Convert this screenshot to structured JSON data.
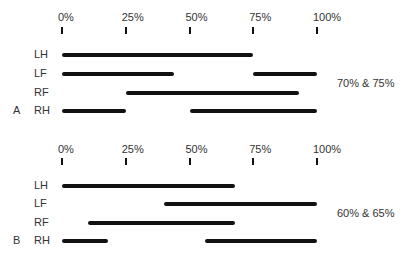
{
  "chart_data": [
    {
      "type": "gantt",
      "title": "",
      "panel": "A",
      "caption": "70% & 75%",
      "axis": {
        "ticks": [
          "0%",
          "25%",
          "50%",
          "75%",
          "100%"
        ],
        "range": [
          0,
          100
        ]
      },
      "rows": [
        {
          "label": "LH",
          "segments": [
            [
              0,
              75
            ]
          ]
        },
        {
          "label": "LF",
          "segments": [
            [
              0,
              44
            ],
            [
              75,
              100
            ]
          ]
        },
        {
          "label": "RF",
          "segments": [
            [
              25,
              93
            ]
          ]
        },
        {
          "label": "RH",
          "segments": [
            [
              0,
              25
            ],
            [
              50,
              100
            ]
          ]
        }
      ]
    },
    {
      "type": "gantt",
      "title": "",
      "panel": "B",
      "caption": "60% & 65%",
      "axis": {
        "ticks": [
          "0%",
          "25%",
          "50%",
          "75%",
          "100%"
        ],
        "range": [
          0,
          100
        ]
      },
      "rows": [
        {
          "label": "LH",
          "segments": [
            [
              0,
              68
            ]
          ]
        },
        {
          "label": "LF",
          "segments": [
            [
              40,
              100
            ]
          ]
        },
        {
          "label": "RF",
          "segments": [
            [
              10,
              68
            ]
          ]
        },
        {
          "label": "RH",
          "segments": [
            [
              0,
              18
            ]
          ],
          "segments_extra": [
            [
              56,
              100
            ]
          ]
        }
      ]
    }
  ],
  "panels": [
    {
      "letter": "A",
      "caption": "70% & 75%",
      "ticks": [
        "0%",
        "25%",
        "50%",
        "75%",
        "100%"
      ],
      "rows": [
        "LH",
        "LF",
        "RF",
        "RH"
      ]
    },
    {
      "letter": "B",
      "caption": "60% & 65%",
      "ticks": [
        "0%",
        "25%",
        "50%",
        "75%",
        "100%"
      ],
      "rows": [
        "LH",
        "LF",
        "RF",
        "RH"
      ]
    }
  ]
}
